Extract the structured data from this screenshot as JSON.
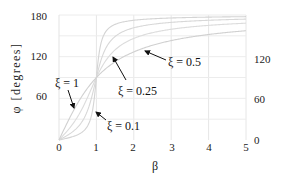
{
  "chart_data": {
    "type": "line",
    "title": "",
    "xlabel": "β",
    "ylabel": "φ [degrees]",
    "xlim": [
      0,
      5
    ],
    "ylim": [
      0,
      180
    ],
    "xticks": [
      "0",
      "1",
      "2",
      "3",
      "4",
      "5"
    ],
    "yticks_left": [
      "60",
      "120",
      "180"
    ],
    "yticks_right": [
      "0",
      "60",
      "120"
    ],
    "grid": true,
    "formula": "phi = atan2(2*xi*beta, 1 - beta^2) in degrees",
    "series": [
      {
        "name": "ξ = 0.1",
        "xi": 0.1,
        "x": [
          0,
          0.5,
          0.8,
          0.9,
          1.0,
          1.1,
          1.2,
          1.5,
          2,
          3,
          4,
          5
        ],
        "y": [
          0,
          7.6,
          24.0,
          43.5,
          90,
          133.7,
          155.6,
          170.9,
          172.4,
          175.7,
          176.9,
          177.6
        ]
      },
      {
        "name": "ξ = 0.25",
        "xi": 0.25,
        "x": [
          0,
          0.5,
          0.8,
          1.0,
          1.2,
          1.5,
          2,
          3,
          4,
          5
        ],
        "y": [
          0,
          18.4,
          48.0,
          90,
          126.2,
          148.0,
          161.6,
          169.4,
          172.4,
          174.0
        ]
      },
      {
        "name": "ξ = 0.5",
        "xi": 0.5,
        "x": [
          0,
          0.5,
          0.8,
          1.0,
          1.2,
          1.5,
          2,
          3,
          4,
          5
        ],
        "y": [
          0,
          33.7,
          65.8,
          90,
          110.6,
          129.8,
          146.3,
          159.4,
          165.1,
          168.2
        ]
      },
      {
        "name": "ξ = 1",
        "xi": 1,
        "x": [
          0,
          0.5,
          0.8,
          1.0,
          1.2,
          1.5,
          2,
          3,
          4,
          5
        ],
        "y": [
          0,
          53.1,
          77.3,
          90,
          100.4,
          112.6,
          126.9,
          143.1,
          151.9,
          157.4
        ]
      }
    ],
    "annotations": [
      {
        "text": "ξ = 1",
        "target_series": "ξ = 1"
      },
      {
        "text": "ξ = 0.25",
        "target_series": "ξ = 0.25"
      },
      {
        "text": "ξ = 0.5",
        "target_series": "ξ = 0.5"
      },
      {
        "text": "ξ = 0.1",
        "target_series": "ξ = 0.1"
      }
    ]
  }
}
